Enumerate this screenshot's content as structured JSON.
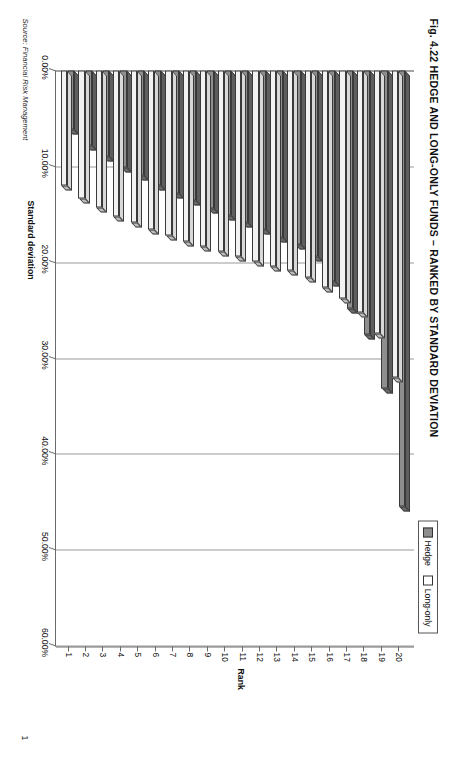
{
  "figure": {
    "title": "Fig. 4.22  HEDGE AND LONG-ONLY FUNDS – RANKED BY STANDARD DEVIATION",
    "source_note": "Source: Financial Risk Management",
    "page_number": "1"
  },
  "legend": {
    "position": "top-right",
    "items": [
      {
        "label": "Hedge",
        "color": "#8e8e8e",
        "swatch": "hedge"
      },
      {
        "label": "Long-only",
        "color": "#ffffff",
        "swatch": "longonly"
      }
    ]
  },
  "chart_data": {
    "type": "bar",
    "orientation": "horizontal",
    "title": "Fig. 4.22  HEDGE AND LONG-ONLY FUNDS – RANKED BY STANDARD DEVIATION",
    "xlabel": "Standard deviation",
    "ylabel": "Rank",
    "categories": [
      "1",
      "2",
      "3",
      "4",
      "5",
      "6",
      "7",
      "8",
      "9",
      "10",
      "11",
      "12",
      "13",
      "14",
      "15",
      "16",
      "17",
      "18",
      "19",
      "20"
    ],
    "value_axis_ticks": [
      "0.00%",
      "10.00%",
      "20.00%",
      "30.00%",
      "40.00%",
      "50.00%",
      "60.00%"
    ],
    "value_axis_tick_values": [
      0,
      10,
      20,
      30,
      40,
      50,
      60
    ],
    "xlim": [
      0,
      60
    ],
    "grid": true,
    "legend_position": "top-right",
    "units": "percent",
    "series": [
      {
        "name": "Hedge",
        "color": "#8e8e8e",
        "values": [
          6.2,
          7.8,
          9.0,
          10.1,
          11.0,
          12.0,
          12.8,
          13.6,
          14.4,
          15.1,
          15.9,
          16.6,
          17.4,
          18.2,
          19.4,
          22.0,
          24.8,
          27.5,
          33.2,
          45.5
        ]
      },
      {
        "name": "Long-only",
        "color": "#ffffff",
        "values": [
          12.0,
          13.4,
          14.3,
          15.2,
          15.9,
          16.6,
          17.2,
          17.8,
          18.4,
          18.9,
          19.4,
          19.9,
          20.4,
          20.9,
          21.6,
          22.6,
          23.8,
          25.2,
          27.4,
          32.0
        ]
      }
    ]
  }
}
